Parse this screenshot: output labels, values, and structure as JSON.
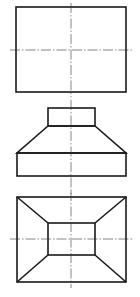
{
  "drawing": {
    "type": "orthographic-projection",
    "views": [
      {
        "name": "front-view",
        "outer_rect": {
          "x": 16,
          "y": 7,
          "w": 110,
          "h": 85
        },
        "centerline_v": {
          "x": 71,
          "y1": 3,
          "y2": 97
        },
        "centerline_h": {
          "y": 50,
          "x1": 10,
          "x2": 134
        }
      },
      {
        "name": "side-view",
        "top_block": {
          "x": 48,
          "y": 108,
          "w": 47,
          "h": 18
        },
        "frustum": {
          "top_y": 126,
          "bottom_y": 153,
          "top_x1": 48,
          "top_x2": 95,
          "bottom_x1": 17,
          "bottom_x2": 126
        },
        "base_block": {
          "x": 17,
          "y": 153,
          "w": 109,
          "h": 23
        },
        "centerline_v": {
          "x": 71,
          "y1": 100,
          "y2": 194
        }
      },
      {
        "name": "top-view",
        "outer_rect": {
          "x": 17,
          "y": 197,
          "w": 109,
          "h": 85
        },
        "inner_rect": {
          "x": 48,
          "y": 223,
          "w": 47,
          "h": 32
        },
        "centerline_v": {
          "x": 71,
          "y1": 191,
          "y2": 288
        },
        "centerline_h": {
          "y": 239,
          "x1": 10,
          "x2": 134
        }
      }
    ],
    "colors": {
      "line": "#1a1a1a",
      "centerline": "#333333",
      "background": "#ffffff"
    }
  }
}
